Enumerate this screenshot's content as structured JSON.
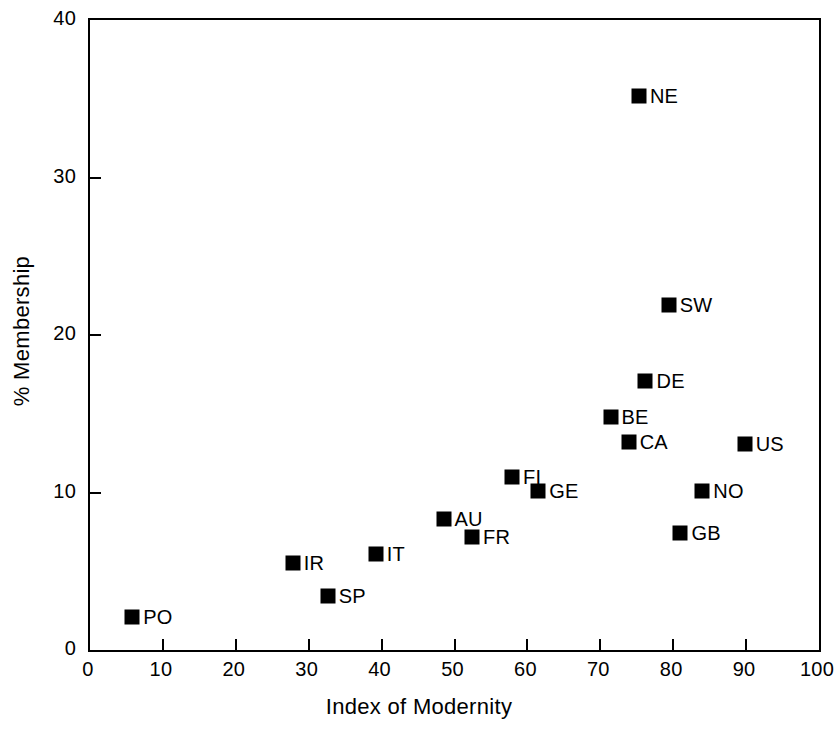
{
  "chart_data": {
    "type": "scatter",
    "title": "",
    "xlabel": "Index of Modernity",
    "ylabel": "% Membership",
    "xlim": [
      0,
      100
    ],
    "ylim": [
      0,
      40
    ],
    "xticks": [
      0,
      10,
      20,
      30,
      40,
      50,
      60,
      70,
      80,
      90,
      100
    ],
    "yticks": [
      0,
      10,
      20,
      30,
      40
    ],
    "grid": false,
    "legend": "none",
    "marker_style": "filled-square",
    "marker_color": "#000000",
    "points": [
      {
        "label": "PO",
        "x": 5.8,
        "y": 2.1,
        "label_side": "right"
      },
      {
        "label": "IR",
        "x": 27.8,
        "y": 5.5,
        "label_side": "right"
      },
      {
        "label": "SP",
        "x": 32.6,
        "y": 3.4,
        "label_side": "right"
      },
      {
        "label": "IT",
        "x": 39.2,
        "y": 6.1,
        "label_side": "right"
      },
      {
        "label": "AU",
        "x": 48.5,
        "y": 8.3,
        "label_side": "right"
      },
      {
        "label": "FR",
        "x": 52.4,
        "y": 7.2,
        "label_side": "right"
      },
      {
        "label": "FI",
        "x": 57.9,
        "y": 11.0,
        "label_side": "right"
      },
      {
        "label": "GE",
        "x": 61.5,
        "y": 10.1,
        "label_side": "right"
      },
      {
        "label": "BE",
        "x": 71.4,
        "y": 14.8,
        "label_side": "right"
      },
      {
        "label": "CA",
        "x": 73.9,
        "y": 13.2,
        "label_side": "right"
      },
      {
        "label": "NE",
        "x": 75.3,
        "y": 35.2,
        "label_side": "right"
      },
      {
        "label": "SW",
        "x": 79.4,
        "y": 21.9,
        "label_side": "right"
      },
      {
        "label": "DE",
        "x": 76.2,
        "y": 17.1,
        "label_side": "right"
      },
      {
        "label": "GB",
        "x": 81.0,
        "y": 7.4,
        "label_side": "right"
      },
      {
        "label": "NO",
        "x": 84.0,
        "y": 10.1,
        "label_side": "right"
      },
      {
        "label": "US",
        "x": 89.8,
        "y": 13.1,
        "label_side": "right"
      }
    ]
  },
  "axes": {
    "x_title": "Index of Modernity",
    "y_title": "% Membership",
    "x_tick_labels": [
      "0",
      "10",
      "20",
      "30",
      "40",
      "50",
      "60",
      "70",
      "80",
      "90",
      "100"
    ],
    "y_tick_labels": [
      "0",
      "10",
      "20",
      "30",
      "40"
    ]
  }
}
